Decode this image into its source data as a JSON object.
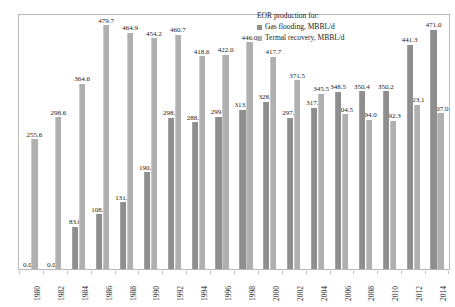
{
  "legend": {
    "title": "EOR production for:",
    "entries": [
      {
        "label": "Gas flooding, MBBL/d",
        "color": "#8e8e8e",
        "key": "gas"
      },
      {
        "label": "Termal recovery, MBBL/d",
        "color": "#b0b0b0",
        "key": "thermal"
      }
    ]
  },
  "chart_data": {
    "type": "bar",
    "title": "",
    "subtitle": "",
    "xlabel": "",
    "ylabel": "",
    "grid": false,
    "legend_position": "top-right",
    "ylim": [
      0,
      500
    ],
    "categories": [
      "1980",
      "1982",
      "1984",
      "1986",
      "1988",
      "1990",
      "1992",
      "1994",
      "1996",
      "1998",
      "2000",
      "2002",
      "2004",
      "2006",
      "2008",
      "2010",
      "2012",
      "2014"
    ],
    "series": [
      {
        "name": "Gas flooding, MBBL/d",
        "color": "#8e8e8e",
        "values": [
          0.0,
          0.0,
          83.0,
          108.2,
          131.0,
          190.6,
          298.0,
          288.6,
          299.3,
          313.5,
          328.8,
          297.5,
          317.9,
          348.5,
          350.4,
          350.2,
          441.3,
          471.0
        ],
        "labels": [
          "0.0",
          "0.0",
          "83.0",
          "108.2",
          "131.0",
          "190.6",
          "298.0",
          "288.6",
          "299.3",
          "313.5",
          "328.8",
          "297.5",
          "317.9",
          "348.5",
          "350.4",
          "350.2",
          "441.3",
          "471.0"
        ]
      },
      {
        "name": "Termal recovery, MBBL/d",
        "color": "#b0b0b0",
        "values": [
          255.6,
          298.6,
          364.6,
          479.7,
          464.9,
          454.2,
          460.7,
          418.6,
          422.0,
          446.0,
          417.7,
          371.5,
          345.5,
          304.5,
          294.0,
          292.3,
          323.1,
          307.0
        ],
        "labels": [
          "255.6",
          "298.6",
          "364.6",
          "479.7",
          "464.9",
          "454.2",
          "460.7",
          "418.6",
          "422.0",
          "446.0",
          "417.7",
          "371.5",
          "345.5",
          "304.5",
          "294.0",
          "292.3",
          "323.1",
          "307.0"
        ]
      }
    ]
  }
}
